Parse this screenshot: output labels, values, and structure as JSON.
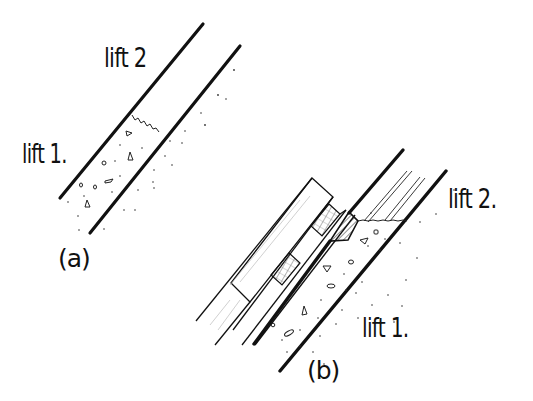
{
  "figure": {
    "background": "#ffffff",
    "ink": "#111111",
    "panels": [
      {
        "id": "a",
        "caption": "(a)",
        "labels": {
          "upper": "lift 2",
          "lower": "lift 1."
        },
        "description": "Two parallel diagonal form walls; lower portion filled with concrete (lift 1) with aggregate; wavy construction joint; upper portion empty (lift 2)"
      },
      {
        "id": "b",
        "caption": "(b)",
        "labels": {
          "upper": "lift 2.",
          "lower": "lift 1."
        },
        "description": "Formwork panel with studs and hatched timber blocks against wall; hatched keyway/bevel strip at joint; lift 1 concrete below, lift 2 above"
      }
    ]
  }
}
